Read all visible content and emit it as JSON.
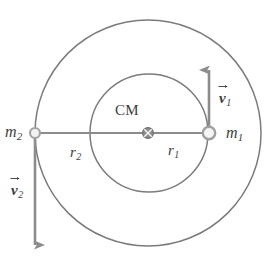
{
  "figure": {
    "title": "",
    "colors": {
      "orbit_stroke": "#7b7b7b",
      "axis_line": "#8c8c8c",
      "vector_stroke": "#8c8c8c",
      "text": "#3d3d3d",
      "body_fill": "#f2f2f2",
      "body_stroke": "#9a9a9a",
      "cm_fill": "#8d8d8d",
      "background": "#ffffff"
    }
  },
  "geometry": {
    "center_of_mass": {
      "x": 148,
      "y": 133
    },
    "outer_orbit": {
      "cx": 148,
      "cy": 133,
      "r": 113
    },
    "inner_orbit": {
      "cx": 149,
      "cy": 133,
      "r": 59
    },
    "body_m1": {
      "x": 209,
      "y": 133,
      "r": 6.5
    },
    "body_m2": {
      "x": 35,
      "y": 133,
      "r": 5.2
    },
    "cm_marker_r": 5.4,
    "axis_line": {
      "x1": 35,
      "y1": 133,
      "x2": 209,
      "y2": 133
    },
    "vector_v1": {
      "x": 209,
      "y_tail": 133,
      "y_head": 69
    },
    "vector_v2": {
      "x": 35,
      "y_tail": 133,
      "y_head": 246
    }
  },
  "labels": {
    "mass1": {
      "symbol": "m",
      "subscript": "1"
    },
    "mass2": {
      "symbol": "m",
      "subscript": "2"
    },
    "radius1": {
      "symbol": "r",
      "subscript": "1"
    },
    "radius2": {
      "symbol": "r",
      "subscript": "2"
    },
    "center_of_mass": "CM",
    "velocity1": {
      "symbol": "v",
      "subscript": "1"
    },
    "velocity2": {
      "symbol": "v",
      "subscript": "2"
    }
  },
  "icons": {
    "cm_marker": "crossed-circle-icon",
    "body_marker": "open-circle-icon",
    "arrow_head": "arrowhead-icon",
    "vector_overbar": "vector-arrow-icon"
  }
}
